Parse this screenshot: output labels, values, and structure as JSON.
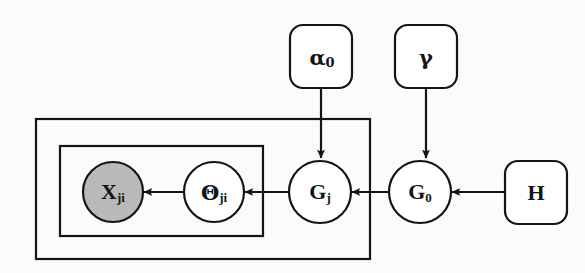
{
  "diagram": {
    "type": "plate-notation-graphical-model",
    "background_color": "#fbfbfa",
    "stroke_color": "#141414",
    "observed_fill": "#b9b9b9",
    "latent_fill": "#ffffff"
  },
  "nodes": [
    {
      "id": "x-ji",
      "kind": "random-variable",
      "shape": "circle",
      "observed": true,
      "fill": "#b9b9b9",
      "label": "X",
      "subscript": "ji",
      "cx": 113,
      "cy": 192,
      "r": 30
    },
    {
      "id": "theta-ji",
      "kind": "random-variable",
      "shape": "circle",
      "observed": false,
      "fill": "#ffffff",
      "label": "Θ",
      "subscript": "ji",
      "cx": 214,
      "cy": 192,
      "r": 30
    },
    {
      "id": "g-j",
      "kind": "random-variable",
      "shape": "circle",
      "observed": false,
      "fill": "#ffffff",
      "label": "G",
      "subscript": "j",
      "cx": 320,
      "cy": 192,
      "r": 31
    },
    {
      "id": "g-0",
      "kind": "random-variable",
      "shape": "circle",
      "observed": false,
      "fill": "#ffffff",
      "label": "G",
      "subscript": "0",
      "cx": 420,
      "cy": 192,
      "r": 31
    },
    {
      "id": "alpha-0",
      "kind": "hyperparameter",
      "shape": "rounded-square",
      "observed": false,
      "fill": "#ffffff",
      "label": "α",
      "subscript": "0",
      "x": 290,
      "y": 25,
      "w": 62,
      "h": 63
    },
    {
      "id": "gamma",
      "kind": "hyperparameter",
      "shape": "rounded-square",
      "observed": false,
      "fill": "#ffffff",
      "label": "γ",
      "subscript": "",
      "x": 395,
      "y": 25,
      "w": 62,
      "h": 63
    },
    {
      "id": "h",
      "kind": "hyperparameter",
      "shape": "rounded-square",
      "observed": false,
      "fill": "#ffffff",
      "label": "H",
      "subscript": "",
      "x": 505,
      "y": 161,
      "w": 62,
      "h": 63
    }
  ],
  "plates": [
    {
      "id": "outer-plate",
      "label": "",
      "x": 36,
      "y": 119,
      "w": 334,
      "h": 140
    },
    {
      "id": "inner-plate",
      "label": "",
      "x": 60,
      "y": 146,
      "w": 203,
      "h": 90
    }
  ],
  "edges": [
    {
      "id": "theta-to-x",
      "from": "theta-ji",
      "to": "x-ji",
      "direction": "left"
    },
    {
      "id": "gj-to-theta",
      "from": "g-j",
      "to": "theta-ji",
      "direction": "left"
    },
    {
      "id": "g0-to-gj",
      "from": "g-0",
      "to": "g-j",
      "direction": "left"
    },
    {
      "id": "h-to-g0",
      "from": "h",
      "to": "g-0",
      "direction": "left"
    },
    {
      "id": "alpha0-to-gj",
      "from": "alpha-0",
      "to": "g-j",
      "direction": "down"
    },
    {
      "id": "gamma-to-g0",
      "from": "gamma",
      "to": "g-0",
      "direction": "down"
    }
  ]
}
